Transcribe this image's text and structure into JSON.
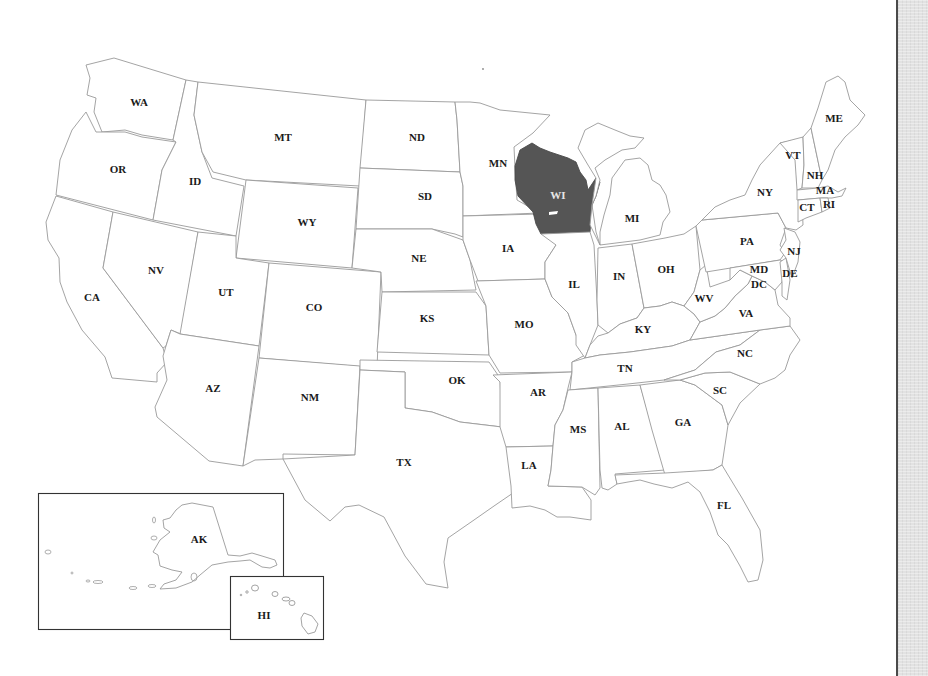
{
  "map": {
    "title": "United States map",
    "highlight_color": "#555555",
    "highlighted_state": "WI",
    "states": {
      "WA": {
        "label": "WA",
        "lx": 139,
        "ly": 103
      },
      "OR": {
        "label": "OR",
        "lx": 118,
        "ly": 170
      },
      "CA": {
        "label": "CA",
        "lx": 92,
        "ly": 298
      },
      "ID": {
        "label": "ID",
        "lx": 195,
        "ly": 182
      },
      "NV": {
        "label": "NV",
        "lx": 156,
        "ly": 271
      },
      "MT": {
        "label": "MT",
        "lx": 283,
        "ly": 138
      },
      "WY": {
        "label": "WY",
        "lx": 307,
        "ly": 223
      },
      "UT": {
        "label": "UT",
        "lx": 226,
        "ly": 293
      },
      "AZ": {
        "label": "AZ",
        "lx": 213,
        "ly": 389
      },
      "CO": {
        "label": "CO",
        "lx": 314,
        "ly": 308
      },
      "NM": {
        "label": "NM",
        "lx": 310,
        "ly": 398
      },
      "ND": {
        "label": "ND",
        "lx": 417,
        "ly": 138
      },
      "SD": {
        "label": "SD",
        "lx": 425,
        "ly": 197
      },
      "NE": {
        "label": "NE",
        "lx": 419,
        "ly": 259
      },
      "KS": {
        "label": "KS",
        "lx": 427,
        "ly": 319
      },
      "OK": {
        "label": "OK",
        "lx": 457,
        "ly": 381
      },
      "TX": {
        "label": "TX",
        "lx": 404,
        "ly": 463
      },
      "MN": {
        "label": "MN",
        "lx": 498,
        "ly": 164
      },
      "IA": {
        "label": "IA",
        "lx": 508,
        "ly": 249
      },
      "MO": {
        "label": "MO",
        "lx": 524,
        "ly": 325
      },
      "AR": {
        "label": "AR",
        "lx": 538,
        "ly": 393
      },
      "LA": {
        "label": "LA",
        "lx": 529,
        "ly": 466
      },
      "WI": {
        "label": "WI",
        "lx": 558,
        "ly": 196
      },
      "IL": {
        "label": "IL",
        "lx": 574,
        "ly": 285
      },
      "MI": {
        "label": "MI",
        "lx": 632,
        "ly": 219
      },
      "IN": {
        "label": "IN",
        "lx": 619,
        "ly": 277
      },
      "OH": {
        "label": "OH",
        "lx": 666,
        "ly": 270
      },
      "KY": {
        "label": "KY",
        "lx": 643,
        "ly": 330
      },
      "TN": {
        "label": "TN",
        "lx": 625,
        "ly": 369
      },
      "MS": {
        "label": "MS",
        "lx": 578,
        "ly": 430
      },
      "AL": {
        "label": "AL",
        "lx": 622,
        "ly": 427
      },
      "GA": {
        "label": "GA",
        "lx": 683,
        "ly": 423
      },
      "FL": {
        "label": "FL",
        "lx": 724,
        "ly": 506
      },
      "SC": {
        "label": "SC",
        "lx": 720,
        "ly": 391
      },
      "NC": {
        "label": "NC",
        "lx": 745,
        "ly": 354
      },
      "VA": {
        "label": "VA",
        "lx": 746,
        "ly": 314
      },
      "WV": {
        "label": "WV",
        "lx": 704,
        "ly": 299
      },
      "PA": {
        "label": "PA",
        "lx": 747,
        "ly": 242
      },
      "NY": {
        "label": "NY",
        "lx": 765,
        "ly": 193
      },
      "NJ": {
        "label": "NJ",
        "lx": 794,
        "ly": 252
      },
      "DE": {
        "label": "DE",
        "lx": 790,
        "ly": 274
      },
      "MD": {
        "label": "MD",
        "lx": 759,
        "ly": 270
      },
      "DC": {
        "label": "DC",
        "lx": 759,
        "ly": 285
      },
      "VT": {
        "label": "VT",
        "lx": 793,
        "ly": 156
      },
      "NH": {
        "label": "NH",
        "lx": 815,
        "ly": 176
      },
      "MA": {
        "label": "MA",
        "lx": 825,
        "ly": 191
      },
      "CT": {
        "label": "CT",
        "lx": 807,
        "ly": 208
      },
      "RI": {
        "label": "RI",
        "lx": 829,
        "ly": 205
      },
      "ME": {
        "label": "ME",
        "lx": 834,
        "ly": 119
      },
      "AK": {
        "label": "AK",
        "lx": 199,
        "ly": 540
      },
      "HI": {
        "label": "HI",
        "lx": 264,
        "ly": 616
      }
    }
  }
}
